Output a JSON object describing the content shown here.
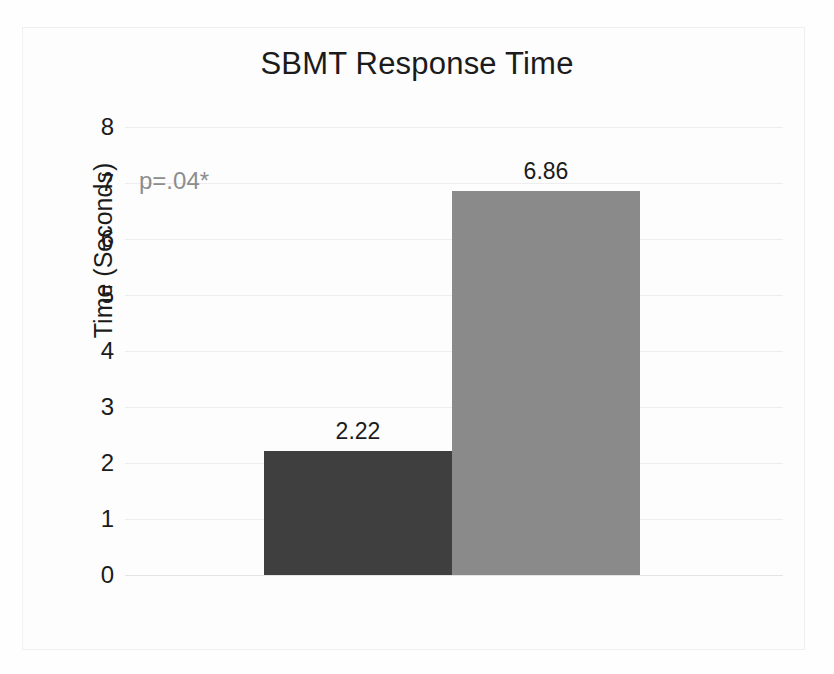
{
  "chart_data": {
    "type": "bar",
    "title": "SBMT Response Time",
    "xlabel": "",
    "ylabel": "Time (Seconds)",
    "categories": [
      "US",
      "TD"
    ],
    "values": [
      2.22,
      6.86
    ],
    "value_labels": [
      "2.22",
      "6.86"
    ],
    "ylim": [
      0,
      8
    ],
    "ytick_labels": [
      "8",
      "7",
      "6",
      "5",
      "4",
      "3",
      "2",
      "1",
      "0"
    ],
    "yticks": [
      8,
      7,
      6,
      5,
      4,
      3,
      2,
      1,
      0
    ],
    "grid": true,
    "legend": "none",
    "annotations": [
      {
        "text": "p=.04*",
        "color": "#8d8d8d"
      }
    ],
    "bar_colors": [
      "#3f3f3f",
      "#8a8a8a"
    ]
  },
  "annotation_text": "p=.04*"
}
